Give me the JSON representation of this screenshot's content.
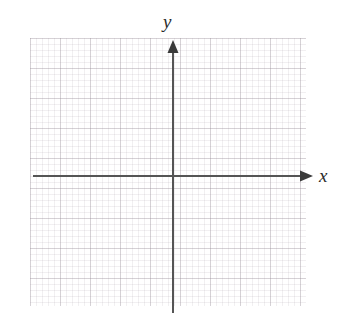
{
  "figure": {
    "kind": "cartesian-coordinate-grid",
    "width": 338,
    "height": 325,
    "background_color": "#ffffff"
  },
  "chart_data": {
    "type": "scatter",
    "title": "",
    "subtitle": "",
    "xlabel": "x",
    "ylabel": "y",
    "series": [],
    "x": [],
    "values": [],
    "annotations": [],
    "legend": {
      "entries": [],
      "position": "none"
    },
    "grid": {
      "visible": true,
      "style": "graph-paper",
      "major_spacing_px": 30,
      "minor_spacing_px": 6,
      "major_color": "#968c96",
      "minor_color": "#aaa0aa",
      "left_px": 30,
      "top_px": 38,
      "width_px": 276,
      "height_px": 268,
      "major_columns": 9,
      "major_rows": 9
    },
    "axes": {
      "color": "#555555",
      "line_width_px": 2,
      "origin_px": {
        "x": 173,
        "y": 176
      },
      "x_axis": {
        "label": "x",
        "start_px": {
          "x": 33,
          "y": 176
        },
        "end_px": {
          "x": 313,
          "y": 176
        },
        "arrowhead": "end",
        "tick_labels": [],
        "ticks_visible": false
      },
      "y_axis": {
        "label": "y",
        "start_px": {
          "x": 173,
          "y": 313
        },
        "end_px": {
          "x": 173,
          "y": 40
        },
        "arrowhead": "end",
        "tick_labels": [],
        "ticks_visible": false
      }
    },
    "xlim": [
      null,
      null
    ],
    "ylim": [
      null,
      null
    ]
  },
  "labels": {
    "x_axis_label": "x",
    "y_axis_label": "y"
  }
}
